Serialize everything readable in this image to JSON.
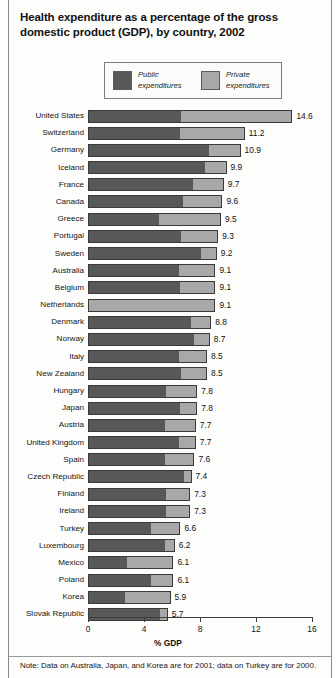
{
  "title": "Health expenditure as a percentage of the gross domestic product (GDP), by country, 2002",
  "legend": {
    "items": [
      {
        "label": "Public\nexpenditures",
        "color": "#585858",
        "name": "public"
      },
      {
        "label": "Private\nexpenditures",
        "color": "#a8a8a8",
        "name": "private"
      }
    ]
  },
  "axis": {
    "title": "% GDP",
    "ticks": [
      "0",
      "4",
      "8",
      "12",
      "16"
    ],
    "min": 0,
    "max": 16
  },
  "note": "Note: Data on Australia, Japan, and Korea are for 2001; data on Turkey are for 2000.",
  "colors": {
    "public": "#585858",
    "private": "#a8a8a8",
    "outline": "#3a3a3a",
    "axis": "#3d3d3d"
  },
  "chart_data": {
    "type": "bar",
    "orientation": "horizontal",
    "stacked": true,
    "title": "Health expenditure as a percentage of the gross domestic product (GDP), by country, 2002",
    "xlabel": "% GDP",
    "ylabel": "",
    "xlim": [
      0,
      16
    ],
    "xticks": [
      0,
      4,
      8,
      12,
      16
    ],
    "grid": false,
    "legend_position": "top",
    "categories": [
      "United States",
      "Switzerland",
      "Germany",
      "Iceland",
      "France",
      "Canada",
      "Greece",
      "Portugal",
      "Sweden",
      "Australia",
      "Belgium",
      "Netherlands",
      "Denmark",
      "Norway",
      "Italy",
      "New Zealand",
      "Hungary",
      "Japan",
      "Austria",
      "United Kingdom",
      "Spain",
      "Czech Republic",
      "Finland",
      "Ireland",
      "Turkey",
      "Luxembourg",
      "Mexico",
      "Poland",
      "Korea",
      "Slovak Republic"
    ],
    "series": [
      {
        "name": "Public expenditures",
        "color": "#585858",
        "values": [
          6.6,
          6.5,
          8.6,
          8.3,
          7.4,
          6.7,
          5.0,
          6.6,
          8.0,
          6.4,
          6.5,
          0.0,
          7.3,
          7.5,
          6.4,
          6.6,
          5.5,
          6.5,
          5.4,
          6.4,
          5.4,
          6.8,
          5.5,
          5.5,
          4.4,
          5.4,
          2.7,
          4.4,
          2.6,
          5.1
        ]
      },
      {
        "name": "Private expenditures",
        "color": "#a8a8a8",
        "values": [
          8.0,
          4.7,
          2.3,
          1.6,
          2.3,
          2.9,
          4.5,
          2.7,
          1.2,
          2.7,
          2.6,
          9.1,
          1.5,
          1.2,
          2.1,
          1.9,
          2.3,
          1.3,
          2.3,
          1.3,
          2.2,
          0.6,
          1.8,
          1.8,
          2.2,
          0.8,
          3.4,
          1.7,
          3.3,
          0.6
        ]
      }
    ],
    "totals": [
      14.6,
      11.2,
      10.9,
      9.9,
      9.7,
      9.6,
      9.5,
      9.3,
      9.2,
      9.1,
      9.1,
      9.1,
      8.8,
      8.7,
      8.5,
      8.5,
      7.8,
      7.8,
      7.7,
      7.7,
      7.6,
      7.4,
      7.3,
      7.3,
      6.6,
      6.2,
      6.1,
      6.1,
      5.9,
      5.7
    ],
    "value_labels": [
      "14.6",
      "11.2",
      "10.9",
      "9.9",
      "9.7",
      "9.6",
      "9.5",
      "9.3",
      "9.2",
      "9.1",
      "9.1",
      "9.1",
      "8.8",
      "8.7",
      "8.5",
      "8.5",
      "7.8",
      "7.8",
      "7.7",
      "7.7",
      "7.6",
      "7.4",
      "7.3",
      "7.3",
      "6.6",
      "6.2",
      "6.1",
      "6.1",
      "5.9",
      "5.7"
    ]
  }
}
